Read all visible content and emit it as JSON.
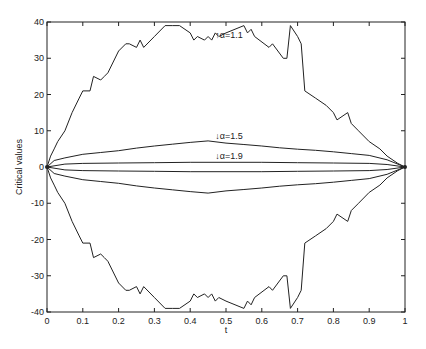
{
  "chart_data": {
    "type": "line",
    "title": "",
    "xlabel": "t",
    "ylabel": "Critical values",
    "xlim": [
      0,
      1
    ],
    "ylim": [
      -40,
      40
    ],
    "grid": false,
    "xticks": [
      0,
      0.1,
      0.2,
      0.3,
      0.4,
      0.5,
      0.6,
      0.7,
      0.8,
      0.9,
      1
    ],
    "xtick_labels": [
      "0",
      "0.1",
      "0.2",
      "0.3",
      "0.4",
      "0.5",
      "0.6",
      "0.7",
      "0.8",
      "0.9",
      "1"
    ],
    "yticks": [
      -40,
      -30,
      -20,
      -10,
      0,
      10,
      20,
      30,
      40
    ],
    "ytick_labels": [
      "-40",
      "-30",
      "-20",
      "-10",
      "0",
      "10",
      "20",
      "30",
      "40"
    ],
    "line_color": "#222222",
    "series": [
      {
        "name": "α=1.1 upper",
        "x": [
          0,
          0.01,
          0.02,
          0.03,
          0.05,
          0.07,
          0.09,
          0.1,
          0.12,
          0.13,
          0.15,
          0.16,
          0.17,
          0.2,
          0.22,
          0.23,
          0.25,
          0.26,
          0.27,
          0.3,
          0.33,
          0.35,
          0.37,
          0.4,
          0.41,
          0.42,
          0.44,
          0.45,
          0.46,
          0.47,
          0.48,
          0.5,
          0.55,
          0.56,
          0.57,
          0.58,
          0.62,
          0.63,
          0.66,
          0.67,
          0.68,
          0.7,
          0.71,
          0.72,
          0.75,
          0.78,
          0.8,
          0.81,
          0.84,
          0.85,
          0.87,
          0.9,
          0.93,
          0.95,
          0.98,
          1.0
        ],
        "values": [
          0,
          3,
          5,
          7,
          10,
          15,
          19,
          21,
          21,
          25,
          24,
          25,
          26,
          32,
          34,
          34,
          33,
          35,
          33,
          36,
          39,
          39,
          39,
          37,
          35,
          36,
          35,
          36,
          35,
          37,
          36,
          37,
          39,
          37,
          38,
          36,
          33,
          34,
          30,
          30,
          39,
          36,
          34,
          21,
          19,
          17,
          15,
          13,
          15,
          12,
          10,
          7,
          5,
          3,
          1,
          0
        ]
      },
      {
        "name": "α=1.1 lower",
        "x": [
          0,
          0.01,
          0.02,
          0.03,
          0.05,
          0.07,
          0.09,
          0.1,
          0.12,
          0.13,
          0.15,
          0.16,
          0.17,
          0.2,
          0.22,
          0.23,
          0.25,
          0.26,
          0.27,
          0.3,
          0.33,
          0.35,
          0.37,
          0.4,
          0.41,
          0.42,
          0.44,
          0.45,
          0.46,
          0.47,
          0.48,
          0.5,
          0.55,
          0.56,
          0.57,
          0.58,
          0.62,
          0.63,
          0.66,
          0.67,
          0.68,
          0.7,
          0.71,
          0.72,
          0.75,
          0.78,
          0.8,
          0.81,
          0.84,
          0.85,
          0.87,
          0.9,
          0.93,
          0.95,
          0.98,
          1.0
        ],
        "values": [
          0,
          -3,
          -5,
          -7,
          -10,
          -15,
          -19,
          -21,
          -21,
          -25,
          -24,
          -25,
          -26,
          -32,
          -34,
          -34,
          -33,
          -35,
          -33,
          -36,
          -39,
          -39,
          -39,
          -37,
          -35,
          -36,
          -35,
          -36,
          -35,
          -37,
          -36,
          -37,
          -39,
          -37,
          -38,
          -36,
          -33,
          -34,
          -30,
          -30,
          -39,
          -36,
          -34,
          -21,
          -19,
          -17,
          -15,
          -13,
          -15,
          -12,
          -10,
          -7,
          -5,
          -3,
          -1,
          0
        ]
      },
      {
        "name": "α=1.5 upper",
        "x": [
          0,
          0.02,
          0.05,
          0.1,
          0.15,
          0.2,
          0.25,
          0.3,
          0.35,
          0.4,
          0.45,
          0.5,
          0.55,
          0.6,
          0.65,
          0.7,
          0.75,
          0.8,
          0.85,
          0.9,
          0.95,
          1.0
        ],
        "values": [
          0,
          1.8,
          2.5,
          3.5,
          4.0,
          4.5,
          5.2,
          5.8,
          6.3,
          6.8,
          7.2,
          6.6,
          6.2,
          5.8,
          5.3,
          4.9,
          4.6,
          4.2,
          3.7,
          3.2,
          2.0,
          0
        ]
      },
      {
        "name": "α=1.5 lower",
        "x": [
          0,
          0.02,
          0.05,
          0.1,
          0.15,
          0.2,
          0.25,
          0.3,
          0.35,
          0.4,
          0.45,
          0.5,
          0.55,
          0.6,
          0.65,
          0.7,
          0.75,
          0.8,
          0.85,
          0.9,
          0.95,
          1.0
        ],
        "values": [
          0,
          -1.8,
          -2.5,
          -3.5,
          -4.0,
          -4.5,
          -5.2,
          -5.8,
          -6.3,
          -6.8,
          -7.2,
          -6.6,
          -6.2,
          -5.8,
          -5.3,
          -4.9,
          -4.6,
          -4.2,
          -3.7,
          -3.2,
          -2.0,
          0
        ]
      },
      {
        "name": "α=1.9 upper",
        "x": [
          0,
          0.05,
          0.1,
          0.2,
          0.3,
          0.4,
          0.5,
          0.6,
          0.7,
          0.8,
          0.9,
          0.95,
          1.0
        ],
        "values": [
          0,
          0.8,
          1.0,
          1.1,
          1.2,
          1.3,
          1.3,
          1.3,
          1.2,
          1.1,
          1.0,
          0.7,
          0
        ]
      },
      {
        "name": "α=1.9 lower",
        "x": [
          0,
          0.05,
          0.1,
          0.2,
          0.3,
          0.4,
          0.5,
          0.6,
          0.7,
          0.8,
          0.9,
          0.95,
          1.0
        ],
        "values": [
          0,
          -0.8,
          -1.0,
          -1.1,
          -1.2,
          -1.3,
          -1.3,
          -1.3,
          -1.2,
          -1.1,
          -1.0,
          -0.7,
          0
        ]
      }
    ],
    "annotations": [
      {
        "text": "↑α=1.1",
        "x": 0.47,
        "y": 35.5
      },
      {
        "text": "↓α=1.5",
        "x": 0.47,
        "y": 7.8
      },
      {
        "text": "↓α=1.9",
        "x": 0.47,
        "y": 2.3
      }
    ]
  }
}
